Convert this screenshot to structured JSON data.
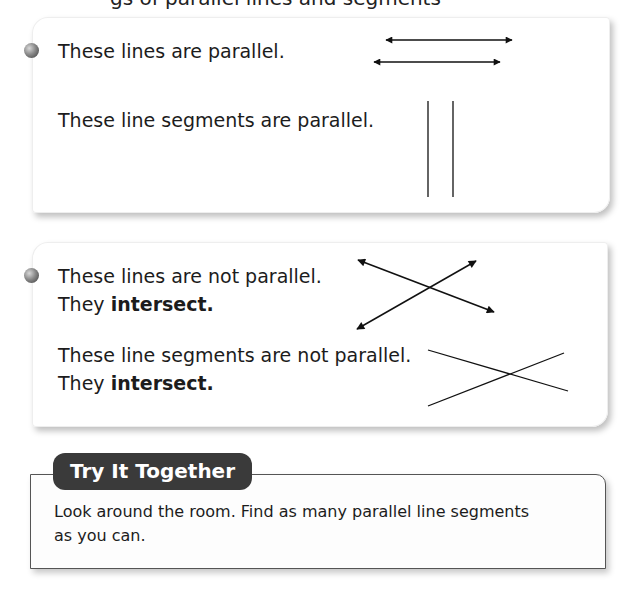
{
  "page": {
    "cutoff_text": "gs of parallel lines and segments"
  },
  "panel1": {
    "line1": "These lines are parallel.",
    "line2": "These line segments are parallel."
  },
  "panel2": {
    "line1": "These lines are not parallel.",
    "line1b_prefix": "They ",
    "line1b_bold": "intersect.",
    "line2": "These line segments are not parallel.",
    "line2b_prefix": "They ",
    "line2b_bold": "intersect."
  },
  "try_it": {
    "label": "Try It Together",
    "text_line1": "Look around the room. Find as many parallel line segments",
    "text_line2": "as you can."
  },
  "colors": {
    "ink": "#1a1a1a",
    "pill_bg": "#3a3a3a",
    "pill_text": "#ffffff",
    "border": "#555555"
  }
}
